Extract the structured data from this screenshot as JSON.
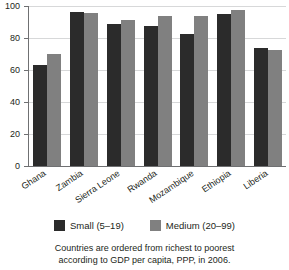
{
  "chart_data": {
    "type": "bar",
    "title": "",
    "xlabel": "",
    "ylabel": "",
    "ylim": [
      0,
      100
    ],
    "yticks": [
      0,
      20,
      40,
      60,
      80,
      100
    ],
    "grid": true,
    "legend_position": "bottom",
    "categories": [
      "Ghana",
      "Zambia",
      "Sierra Leone",
      "Rwanda",
      "Mozambique",
      "Ethiopia",
      "Liberia"
    ],
    "series": [
      {
        "name": "Small (5–19)",
        "color": "#2b2b2b",
        "values": [
          63,
          96,
          88.5,
          87.5,
          82.5,
          95,
          73.5
        ]
      },
      {
        "name": "Medium (20–99)",
        "color": "#808080",
        "values": [
          70,
          95.5,
          91,
          94,
          94,
          97.5,
          72.5
        ]
      }
    ],
    "annotations": [
      "Countries are ordered from richest to poorest",
      "according to GDP per capita, PPP, in 2006."
    ]
  },
  "axes": {
    "y_tick_labels": [
      "100",
      "80",
      "60",
      "40",
      "20",
      "0"
    ],
    "x_tick_labels": [
      "Ghana",
      "Zambia",
      "Sierra Leone",
      "Rwanda",
      "Mozambique",
      "Ethiopia",
      "Liberia"
    ]
  },
  "legend": {
    "items": [
      {
        "label": "Small (5–19)",
        "color": "#2b2b2b"
      },
      {
        "label": "Medium (20–99)",
        "color": "#808080"
      }
    ]
  },
  "caption": {
    "line1": "Countries are ordered from richest to poorest",
    "line2": "according to GDP per capita, PPP, in 2006."
  },
  "colors": {
    "small": "#2b2b2b",
    "medium": "#808080",
    "axis": "#6f7072",
    "gridline": "#d7d8d9",
    "text": "#231f20",
    "background": "#ffffff"
  }
}
